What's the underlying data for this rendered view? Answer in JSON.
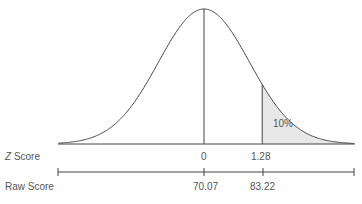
{
  "chart_data": {
    "type": "area",
    "title": "",
    "distribution": {
      "mean_z": 0,
      "sd_z": 1
    },
    "shaded_region": {
      "from_z": 1.28,
      "to_z": "inf",
      "label": "10%",
      "fill": "#e8e8e8"
    },
    "axes": [
      {
        "name": "Z Score",
        "ticks": [
          {
            "z": 0,
            "label": "0"
          },
          {
            "z": 1.28,
            "label": "1.28"
          }
        ]
      },
      {
        "name": "Raw Score",
        "ticks": [
          {
            "z": 0,
            "label": "70.07"
          },
          {
            "z": 1.28,
            "label": "83.22"
          }
        ]
      }
    ],
    "vertical_lines_z": [
      0,
      1.28
    ],
    "grid": false,
    "legend": null
  },
  "labels": {
    "z_axis_italic": "Z",
    "z_axis_rest": " Score",
    "raw_axis": "Raw Score",
    "z_tick_0": "0",
    "z_tick_1": "1.28",
    "raw_tick_0": "70.07",
    "raw_tick_1": "83.22",
    "shaded_pct": "10%"
  },
  "colors": {
    "line": "#444444",
    "shade": "#e8e8e8",
    "text": "#555555"
  }
}
